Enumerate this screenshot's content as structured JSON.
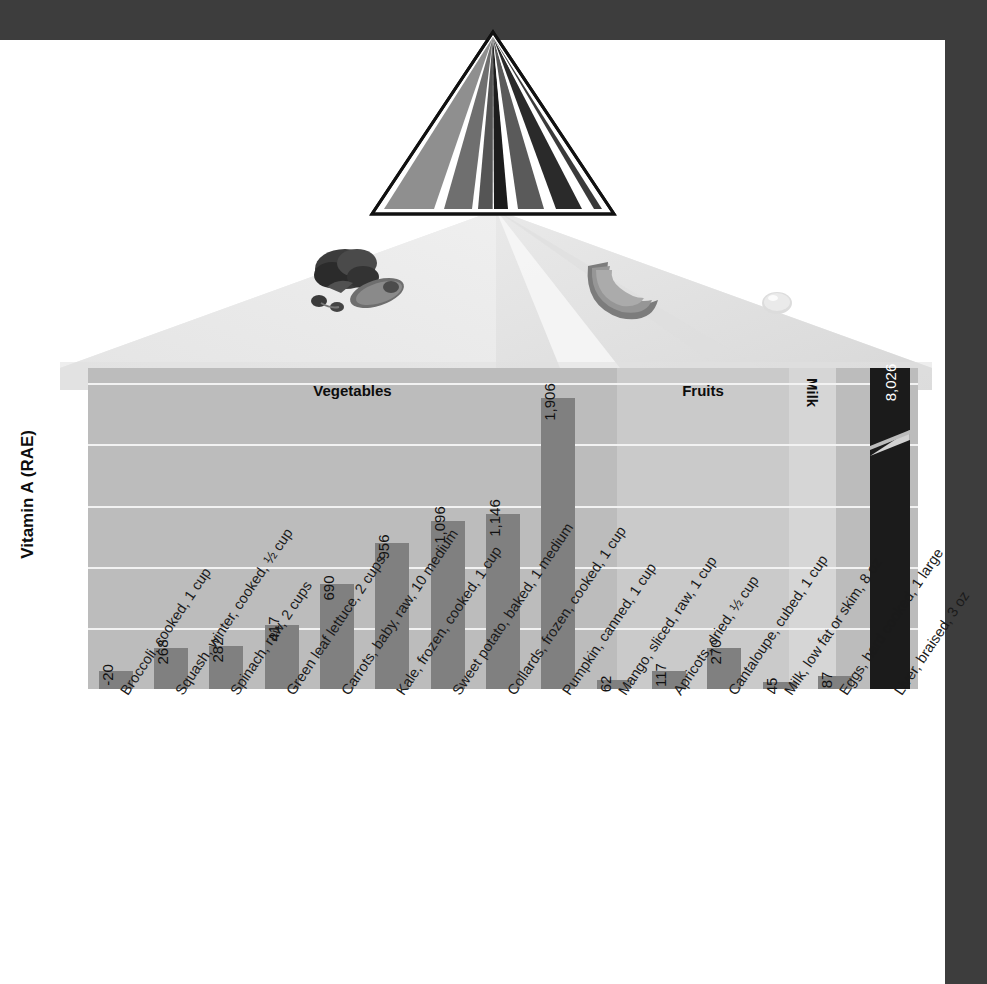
{
  "chart_data": {
    "type": "bar",
    "title": "",
    "subtitle": "",
    "ylabel": "Vitamin A (RAE)",
    "xlabel": "",
    "ylim": [
      0,
      2100
    ],
    "grid": true,
    "gridline_values": [
      400,
      800,
      1200,
      1600,
      2000
    ],
    "legend": "none",
    "note": "Final bar uses a broken axis; its true value far exceeds the axis maximum.",
    "categories": [
      "Broccoli, cooked, 1 cup",
      "Squash, winter, cooked, ½ cup",
      "Spinach, raw, 2 cups",
      "Green leaf lettuce, 2 cups",
      "Carrots, baby, raw, 10 medium",
      "Kale, frozen, cooked, 1 cup",
      "Sweet potato, baked, 1 medium",
      "Collards, frozen, cooked, 1 cup",
      "Pumpkin, canned, 1 cup",
      "Mango, sliced, raw, 1 cup",
      "Apricots, dried, ½ cup",
      "Cantaloupe, cubed, 1 cup",
      "Milk, low fat or skim, 8 oz",
      "Eggs, hard cooked, 1 large",
      "Liver, braised, 3 oz"
    ],
    "values": [
      120,
      268,
      282,
      417,
      690,
      956,
      1096,
      1146,
      1906,
      62,
      117,
      270,
      45,
      87,
      8026
    ],
    "value_labels": [
      "-20",
      "268",
      "282",
      "417",
      "690",
      "956",
      "1,096",
      "1,146",
      "1,906",
      "62",
      "117",
      "270",
      "45",
      "87",
      "8,026"
    ],
    "groups": [
      {
        "name": "Vegetables",
        "orientation": "horizontal",
        "start_index": 0,
        "count": 9
      },
      {
        "name": "Fruits",
        "orientation": "horizontal",
        "start_index": 9,
        "count": 3
      },
      {
        "name": "Milk",
        "orientation": "vertical",
        "start_index": 12,
        "count": 1
      },
      {
        "name": "Meat and Beans",
        "orientation": "vertical",
        "start_index": 13,
        "count": 2
      }
    ]
  },
  "graphic": {
    "pyramid_name": "mypyramid-logo",
    "pyramid_band_colors": [
      "#8f8f8f",
      "#6f6f6f",
      "#1c1c1c",
      "#5a5a5a",
      "#2a2a2a"
    ],
    "food_images": [
      {
        "name": "vegetables-photo",
        "label": "leafy greens and sweet potato"
      },
      {
        "name": "fruit-photo",
        "label": "cantaloupe slice"
      },
      {
        "name": "milk-photo",
        "label": "milk droplet"
      }
    ]
  },
  "colors": {
    "frame": "#3d3d3d",
    "bar": "#808080",
    "bar_highlight": "#1b1b1b",
    "band_vegetables": "#bcbcbc",
    "band_fruits": "#cacaca",
    "band_milk": "#d6d6d6",
    "band_meat": "#bcbcbc",
    "gridline": "#f2f2f2",
    "text": "#111111"
  }
}
